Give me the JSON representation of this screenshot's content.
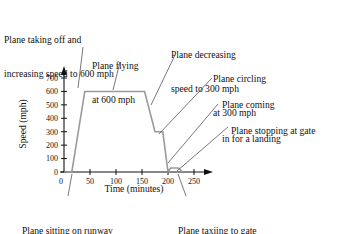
{
  "chart_data": {
    "type": "line",
    "title": "",
    "xlabel": "Time (minutes)",
    "ylabel": "Speed (mph)",
    "xlim": [
      0,
      265
    ],
    "ylim": [
      0,
      730
    ],
    "xticks": [
      0,
      50,
      100,
      150,
      200,
      250
    ],
    "xtick_labels": [
      "0",
      "50",
      "100",
      "150",
      "200",
      "250"
    ],
    "yticks": [
      0,
      100,
      200,
      300,
      400,
      500,
      600,
      700
    ],
    "ytick_labels": [
      "0",
      "100",
      "200",
      "300",
      "400",
      "500",
      "600",
      "700"
    ],
    "grid": false,
    "legend": "none",
    "line_color": "#9a9a9a",
    "series": [
      {
        "name": "Plane speed",
        "x": [
          0,
          15,
          40,
          155,
          175,
          190,
          200,
          205,
          220,
          228
        ],
        "y": [
          0,
          0,
          600,
          600,
          300,
          300,
          0,
          30,
          30,
          0
        ]
      }
    ],
    "annotations": [
      {
        "id": "taking-off",
        "text_lines": [
          "Plane taking off and",
          "increasing speed to 600 mph"
        ],
        "leader_from": [
          83,
          47
        ],
        "leader_to": [
          78,
          88
        ]
      },
      {
        "id": "flying",
        "text_lines": [
          "Plane flying",
          "at 600 mph"
        ],
        "leader_from": [
          120,
          62
        ],
        "leader_to": [
          113,
          90
        ]
      },
      {
        "id": "decreasing",
        "text_lines": [
          "Plane decreasing",
          "speed to 300 mph"
        ],
        "leader_from": [
          175,
          55
        ],
        "leader_to": [
          151,
          105
        ]
      },
      {
        "id": "circling",
        "text_lines": [
          "Plane circling",
          "at 300 mph"
        ],
        "leader_from": [
          212,
          78
        ],
        "leader_to": [
          159,
          134
        ]
      },
      {
        "id": "landing",
        "text_lines": [
          "Plane coming",
          "in for a landing"
        ],
        "leader_from": [
          218,
          104
        ],
        "leader_to": [
          168,
          163
        ]
      },
      {
        "id": "stopping",
        "text_lines": [
          "Plane stopping at gate"
        ],
        "leader_from": [
          228,
          127
        ],
        "leader_to": [
          177,
          171
        ]
      },
      {
        "id": "sitting",
        "text_lines": [
          "Plane sitting on runway"
        ],
        "leader_from": [
          68,
          196
        ],
        "leader_to": [
          72,
          174
        ]
      },
      {
        "id": "taxiing",
        "text_lines": [
          "Plane taxiing to gate"
        ],
        "leader_from": [
          186,
          196
        ],
        "leader_to": [
          178,
          174
        ]
      }
    ]
  },
  "annotations_text": {
    "taking_off_l1": "Plane taking off and",
    "taking_off_l2": "increasing speed to 600 mph",
    "flying_l1": "Plane flying",
    "flying_l2": "at 600 mph",
    "decreasing_l1": "Plane decreasing",
    "decreasing_l2": "speed to 300 mph",
    "circling_l1": "Plane circling",
    "circling_l2": "at 300 mph",
    "landing_l1": "Plane coming",
    "landing_l2": "in for a landing",
    "stopping_l1": "Plane stopping at gate",
    "sitting_l1": "Plane sitting on runway",
    "taxiing_l1": "Plane taxiing to gate"
  },
  "axes": {
    "xlabel": "Time (minutes)",
    "ylabel": "Speed (mph)",
    "origin_label": "0"
  }
}
